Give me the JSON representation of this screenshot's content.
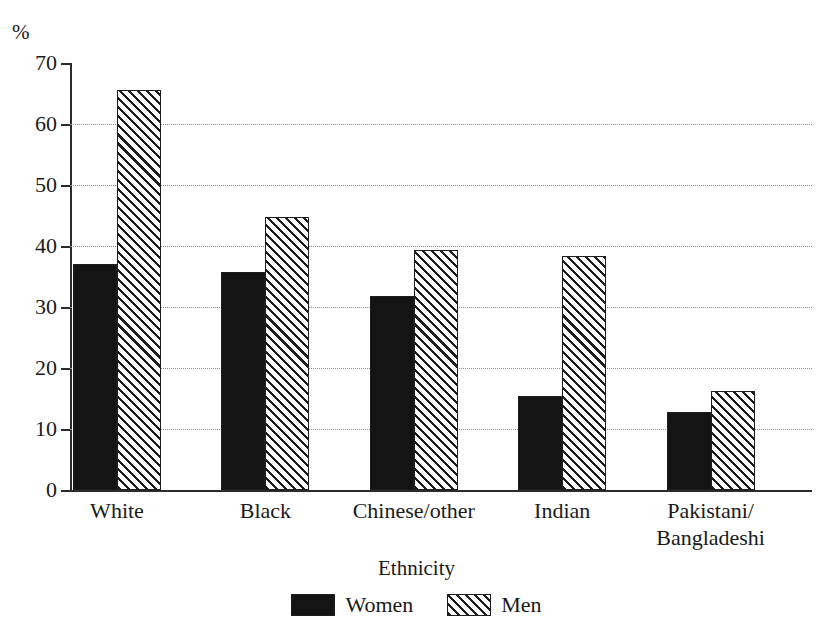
{
  "chart_data": {
    "type": "bar",
    "title": "",
    "subtitle": "",
    "xlabel": "Ethnicity",
    "ylabel": "%",
    "ylim": [
      0,
      70
    ],
    "ytick_step": 10,
    "yticks": [
      "0",
      "10",
      "20",
      "30",
      "40",
      "50",
      "60",
      "70"
    ],
    "grid": "horizontal-dotted",
    "legend_position": "bottom-center",
    "categories": [
      "White",
      "Black",
      "Chinese/other",
      "Indian",
      "Pakistani/\nBangladeshi"
    ],
    "series": [
      {
        "name": "Women",
        "fill": "solid-black",
        "color": "#141414",
        "values": [
          37.0,
          35.7,
          31.8,
          15.4,
          12.8
        ]
      },
      {
        "name": "Men",
        "fill": "diagonal-hatch",
        "color": "#ffffff",
        "values": [
          65.5,
          44.8,
          39.3,
          38.3,
          16.3
        ]
      }
    ]
  },
  "axes": {
    "y_unit_label": "%"
  },
  "legend": {
    "items": [
      {
        "label": "Women",
        "swatch": "solid-swatch"
      },
      {
        "label": "Men",
        "swatch": "hatched-swatch"
      }
    ]
  },
  "colors": {
    "axis": "#2b2b2b",
    "grid": "#8d8d8d",
    "bar_women": "#141414",
    "bar_men_hatch": "#1d1d1d",
    "background": "#ffffff",
    "text": "#1a1a1a"
  }
}
